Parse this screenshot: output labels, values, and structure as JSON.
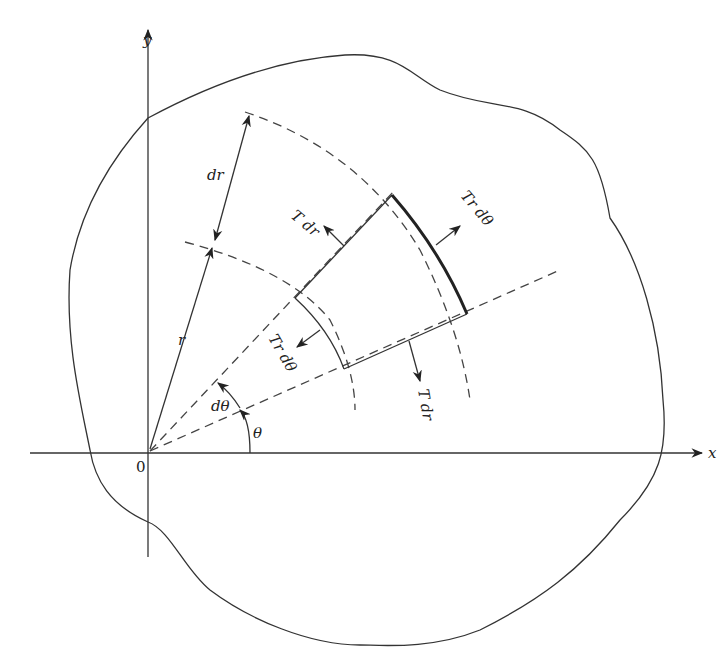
{
  "diagram": {
    "type": "membrane polar element free-body diagram",
    "axes": {
      "x_label": "x",
      "y_label": "y",
      "origin_label": "0"
    },
    "labels": {
      "radius": "r",
      "radial_increment": "dr",
      "angle": "θ",
      "angle_increment": "dθ",
      "force_tdr_upper": "T dr",
      "force_tdr_lower": "T dr",
      "force_trdtheta_outer": "Tr dθ",
      "force_trdtheta_inner": "Tr dθ"
    },
    "colors": {
      "stroke": "#333333",
      "background": "#ffffff"
    }
  }
}
